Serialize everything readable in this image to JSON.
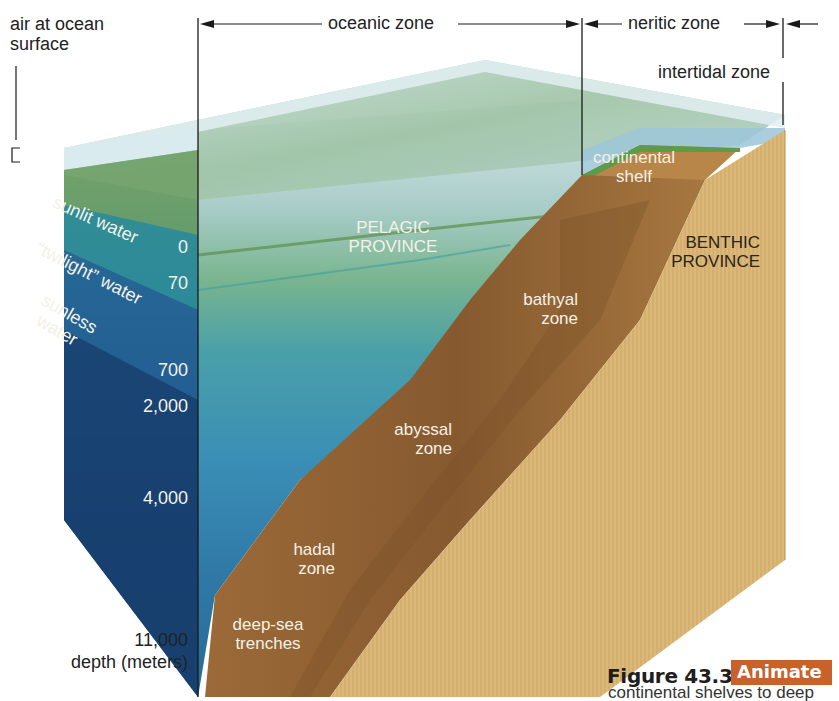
{
  "figure": {
    "title": "Figure 43.35",
    "badge": "Animate",
    "caption": "continental shelves to deep",
    "badge_color": "#c8612a"
  },
  "top_labels": {
    "air_surface_line1": "air at ocean",
    "air_surface_line2": "surface",
    "oceanic_zone": "oceanic zone",
    "neritic_zone": "neritic zone",
    "intertidal_zone": "intertidal zone"
  },
  "water_layers": {
    "sunlit": "sunlit water",
    "twilight": "“twilight” water",
    "sunless_line1": "sunless",
    "sunless_line2": "water"
  },
  "depth_scale": {
    "ticks": [
      "0",
      "70",
      "700",
      "2,000",
      "4,000",
      "11,000"
    ],
    "axis_label": "depth (meters)"
  },
  "regions": {
    "pelagic_line1": "PELAGIC",
    "pelagic_line2": "PROVINCE",
    "benthic_line1": "BENTHIC",
    "benthic_line2": "PROVINCE",
    "continental_line1": "continental",
    "continental_line2": "shelf",
    "bathyal_line1": "bathyal",
    "bathyal_line2": "zone",
    "abyssal_line1": "abyssal",
    "abyssal_line2": "zone",
    "hadal_line1": "hadal",
    "hadal_line2": "zone",
    "trenches_line1": "deep-sea",
    "trenches_line2": "trenches"
  },
  "colors": {
    "surface_air": "#d6e8ee",
    "sunlit": "#6f9a5a",
    "twilight": "#2f8a94",
    "sunless": "#1f5a86",
    "deep": "#173f6b",
    "seafloor": "#8a5a2e",
    "sediment": "#d8b470"
  }
}
